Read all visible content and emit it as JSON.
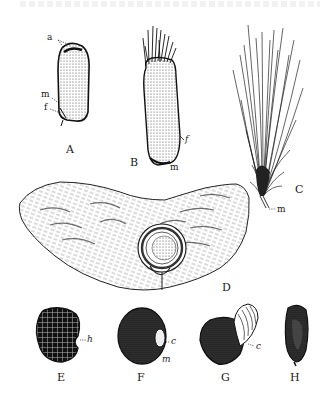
{
  "figure": {
    "panels": [
      {
        "id": "A",
        "label": "A",
        "annotations": [
          "a",
          "m",
          "f"
        ]
      },
      {
        "id": "B",
        "label": "B",
        "annotations": [
          "f",
          "m"
        ]
      },
      {
        "id": "C",
        "label": "C",
        "annotations": [
          "m"
        ]
      },
      {
        "id": "D",
        "label": "D",
        "annotations": []
      },
      {
        "id": "E",
        "label": "E",
        "annotations": [
          "h"
        ]
      },
      {
        "id": "F",
        "label": "F",
        "annotations": [
          "c",
          "m"
        ]
      },
      {
        "id": "G",
        "label": "G",
        "annotations": [
          "c"
        ]
      },
      {
        "id": "H",
        "label": "H",
        "annotations": []
      }
    ],
    "colors": {
      "ink": "#1a1a1a",
      "paper": "#ffffff"
    }
  }
}
